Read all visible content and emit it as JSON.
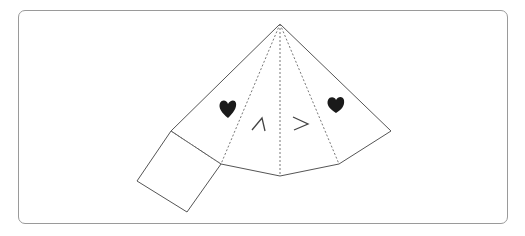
{
  "diagram": {
    "frame": {
      "stroke": "#9a9a9a"
    },
    "line_color": "#555555",
    "fold_color": "#777777",
    "heart_color": "#1a1a1a",
    "face": {
      "left_eye": "^",
      "right_eye": ">"
    },
    "annotations": [
      "left-heart",
      "right-heart"
    ]
  }
}
